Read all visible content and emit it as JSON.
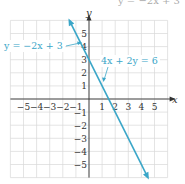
{
  "chart_data": {
    "type": "line",
    "title": "",
    "top_text_fragment": "y = -2x + 3",
    "xlabel": "x",
    "ylabel": "y",
    "xlim": [
      -6,
      6
    ],
    "ylim": [
      -6,
      6
    ],
    "grid": true,
    "x_ticks": [
      "-5",
      "-4",
      "-3",
      "-2",
      "-1",
      "1",
      "2",
      "3",
      "4",
      "5"
    ],
    "y_ticks": [
      "5",
      "4",
      "3",
      "2",
      "1",
      "-1",
      "-2",
      "-3",
      "-4",
      "-5"
    ],
    "series": [
      {
        "name": "y = -2x + 3",
        "equation_alt": "4x + 2y = 6",
        "color": "#3aa6c8",
        "x": [
          -1.5,
          0,
          1.5,
          4.5
        ],
        "y": [
          6,
          3,
          0,
          -6
        ]
      }
    ],
    "annotations": [
      {
        "text": "y = −2x + 3",
        "points_to": [
          0,
          3.8
        ]
      },
      {
        "text": "4x + 2y = 6",
        "points_to": [
          1.2,
          0.6
        ]
      }
    ]
  },
  "labels": {
    "x_axis": "x",
    "y_axis": "y",
    "eq1": "y = −2x + 3",
    "eq2": "4x + 2y = 6",
    "top": "y = −2x + 3"
  },
  "colors": {
    "line": "#3aa6c8",
    "grid": "#d9d9d9",
    "axis": "#333333"
  }
}
